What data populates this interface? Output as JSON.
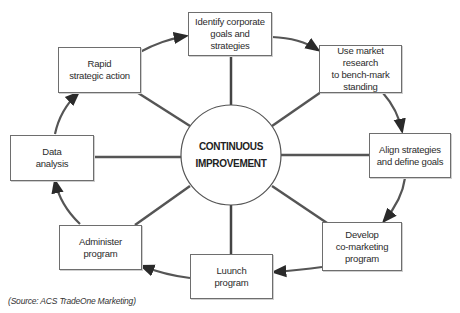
{
  "diagram": {
    "center": {
      "label": "CONTINUOUS\nIMPROVEMENT"
    },
    "steps": [
      {
        "id": "identify",
        "label": "Identify corporate\ngoals and strategies"
      },
      {
        "id": "research",
        "label": "Use market research\nto bench-mark\nstanding"
      },
      {
        "id": "align",
        "label": "Align strategies\nand define goals"
      },
      {
        "id": "develop",
        "label": "Develop\nco-marketing\nprogram"
      },
      {
        "id": "launch",
        "label": "Luunch\nprogram"
      },
      {
        "id": "administer",
        "label": "Administer\nprogram"
      },
      {
        "id": "data",
        "label": "Data\nanalysis"
      },
      {
        "id": "rapid",
        "label": "Rapid\nstrategic action"
      }
    ],
    "flow": [
      "identify",
      "research",
      "align",
      "develop",
      "launch",
      "administer",
      "data",
      "rapid",
      "identify"
    ]
  },
  "source": "(Source: ACS TradeOne Marketing)",
  "colors": {
    "line": "#3a3a3a",
    "line_light": "#a0a0a0",
    "border": "#6e6e6e"
  }
}
